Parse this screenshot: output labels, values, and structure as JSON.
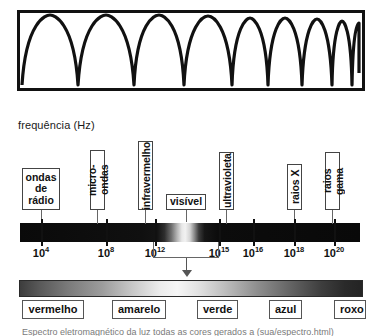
{
  "figure": {
    "frequency_axis_label": "frequência (Hz)"
  },
  "wave_panel": {
    "name": "waveform-illustration",
    "description": "ondas de frequencia crescente"
  },
  "categories": [
    {
      "label": "ondas\nde\nrádio",
      "orientation": "horizontal",
      "left": 22,
      "top": 168,
      "width": 38,
      "height": 42,
      "leader_x": 41,
      "leader_top": 210,
      "leader_height": 14
    },
    {
      "label": "micro-ondas",
      "orientation": "vertical",
      "left": 90,
      "top": 150,
      "width": 15,
      "height": 60,
      "leader_x": 97,
      "leader_top": 210,
      "leader_height": 14
    },
    {
      "label": "infravermelho",
      "orientation": "vertical",
      "left": 138,
      "top": 141,
      "width": 15,
      "height": 69,
      "leader_x": 145,
      "leader_top": 210,
      "leader_height": 14
    },
    {
      "label": "visível",
      "orientation": "horizontal",
      "left": 166,
      "top": 194,
      "width": 40,
      "height": 16,
      "leader_x": 186,
      "leader_top": 210,
      "leader_height": 12
    },
    {
      "label": "ultravioleta",
      "orientation": "vertical",
      "left": 219,
      "top": 152,
      "width": 15,
      "height": 58,
      "leader_x": 226,
      "leader_top": 210,
      "leader_height": 14
    },
    {
      "label": "raios X",
      "orientation": "vertical",
      "left": 287,
      "top": 164,
      "width": 15,
      "height": 46,
      "leader_x": 294,
      "leader_top": 210,
      "leader_height": 14
    },
    {
      "label": "raios gama",
      "orientation": "vertical",
      "left": 325,
      "top": 152,
      "width": 15,
      "height": 58,
      "leader_x": 332,
      "leader_top": 210,
      "leader_height": 14
    }
  ],
  "axis_ticks": [
    {
      "base": "10",
      "exp": "4",
      "x": 41
    },
    {
      "base": "10",
      "exp": "8",
      "x": 106
    },
    {
      "base": "10",
      "exp": "12",
      "x": 155
    },
    {
      "base": "10",
      "exp": "15",
      "x": 219
    },
    {
      "base": "10",
      "exp": "16",
      "x": 253
    },
    {
      "base": "10",
      "exp": "18",
      "x": 294
    },
    {
      "base": "10",
      "exp": "20",
      "x": 334
    }
  ],
  "visible_colors": [
    {
      "label": "vermelho",
      "left": 22,
      "width": 62
    },
    {
      "label": "amarelo",
      "left": 112,
      "width": 54
    },
    {
      "label": "verde",
      "left": 197,
      "width": 41
    },
    {
      "label": "azul",
      "left": 269,
      "width": 33
    },
    {
      "label": "roxo",
      "left": 334,
      "width": 32
    }
  ],
  "bottom_caption": {
    "text": "Espectro eletromagnético da luz todas as cores gerados a (sua/espectro.html)"
  },
  "colors": {
    "outline": "#111111",
    "box_border": "#444444",
    "leader": "#666666",
    "background": "#ffffff"
  },
  "chart_data": {
    "type": "bar",
    "xlabel": "frequência (Hz)",
    "ylabel": "",
    "grid": false,
    "legend": "none",
    "axis_scale": "log10",
    "xlim": [
      3,
      21
    ],
    "tick_labels": [
      "10^4",
      "10^8",
      "10^12",
      "10^15",
      "10^16",
      "10^18",
      "10^20"
    ],
    "tick_values": [
      4,
      8,
      12,
      15,
      16,
      18,
      20
    ],
    "categories": [
      "ondas de rádio",
      "micro-ondas",
      "infravermelho",
      "visível",
      "ultravioleta",
      "raios X",
      "raios gama"
    ],
    "category_positions_log10": [
      4,
      9.5,
      12.5,
      14.6,
      16,
      18,
      20
    ],
    "annotations": [
      "frequência (Hz)"
    ],
    "visible_spectrum": {
      "type": "bar",
      "categories": [
        "vermelho",
        "amarelo",
        "verde",
        "azul",
        "roxo"
      ],
      "values": [
        1,
        1,
        1,
        1,
        1
      ],
      "note": "faixa visível ampliada da esquerda (vermelho) para a direita (roxo)"
    }
  }
}
